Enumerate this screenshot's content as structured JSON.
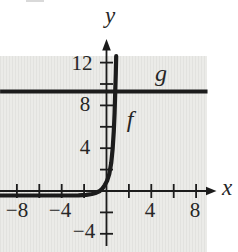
{
  "figure": {
    "type": "math-graph",
    "background_color": "#ffffff",
    "plot_background_color": "#ebebe8",
    "plot_stripe_color": "#e2e2df",
    "line_color": "#1c1c1c",
    "text_color": "#262626"
  },
  "labels": {
    "x_axis": "x",
    "y_axis": "y",
    "curve_f": "f",
    "line_g": "g",
    "x_ticks": [
      "−8",
      "−4",
      "4",
      "8"
    ],
    "y_ticks": [
      "12",
      "8",
      "4",
      "−4"
    ]
  },
  "chart_data": {
    "type": "line",
    "title": "",
    "xlabel": "x",
    "ylabel": "y",
    "xlim": [
      -9.5,
      11.8
    ],
    "ylim": [
      -5.7,
      13.5
    ],
    "x_ticks": [
      -8,
      -6,
      -4,
      -2,
      2,
      4,
      6,
      8
    ],
    "y_ticks": [
      -4,
      -2,
      2,
      4,
      6,
      8,
      10,
      12
    ],
    "x_labeled_ticks": [
      -8,
      -4,
      4,
      8
    ],
    "y_labeled_ticks": [
      12,
      8,
      4,
      -4
    ],
    "tick_step": 2,
    "grid": false,
    "legend": "none; curves labeled inline as f and g",
    "series": [
      {
        "name": "f",
        "style": "thick black exponential curve",
        "description": "exponential growth curve: hugs y=0 along the negative x-axis, bends upward just left of x=0 and rises almost vertically, leaving the top of the plot near x≈0.9; labeled f to the right of the steep section",
        "x": [
          -9.5,
          -7,
          -5,
          -3.5,
          -2.5,
          -1.8,
          -1.3,
          -0.9,
          -0.6,
          -0.35,
          -0.15,
          0.05,
          0.25,
          0.42,
          0.55,
          0.65,
          0.72,
          0.78,
          0.83,
          0.87
        ],
        "y": [
          -0.42,
          -0.42,
          -0.42,
          -0.42,
          -0.4,
          -0.36,
          -0.28,
          -0.16,
          0.0,
          0.25,
          0.55,
          0.95,
          1.6,
          2.6,
          4.0,
          5.6,
          7.3,
          9.2,
          11.0,
          12.6
        ]
      },
      {
        "name": "g",
        "style": "thick black horizontal line",
        "description": "horizontal line spanning the full plot width at y ≈ 9; labeled g above the line on the right side",
        "y": 9.3,
        "x_start": -9.5,
        "x_end": 9.02
      }
    ]
  }
}
